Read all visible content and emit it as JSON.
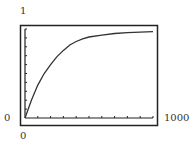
{
  "window": {
    "ymax_label": "1",
    "ymin_label": "0",
    "xmin_label": "0",
    "xmax_label": "1000"
  },
  "colors": {
    "frame": "#222222",
    "curve": "#333333",
    "background": "#ffffff"
  },
  "chart_data": {
    "type": "line",
    "title": "",
    "xlabel": "",
    "ylabel": "",
    "xlim": [
      0,
      1000
    ],
    "ylim": [
      0,
      1
    ],
    "x_ticks_every": 100,
    "y_ticks_every": 0.1,
    "grid": false,
    "legend": null,
    "series": [
      {
        "name": "curve",
        "x": [
          0,
          50,
          100,
          150,
          200,
          250,
          300,
          350,
          400,
          450,
          500,
          600,
          700,
          800,
          900,
          1000
        ],
        "y": [
          0.0,
          0.2,
          0.37,
          0.5,
          0.6,
          0.69,
          0.76,
          0.82,
          0.86,
          0.89,
          0.91,
          0.93,
          0.95,
          0.96,
          0.965,
          0.97
        ]
      }
    ]
  }
}
